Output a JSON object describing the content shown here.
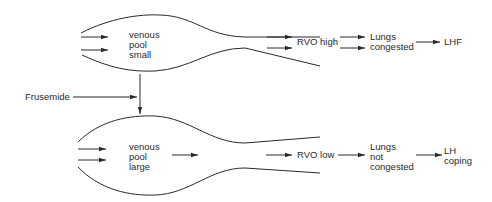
{
  "top_pathway": {
    "venous_pool": [
      "venous",
      "pool",
      "small"
    ],
    "rvo": "RVO high",
    "lungs": [
      "Lungs",
      "congested"
    ],
    "outcome": "LHF"
  },
  "drug": {
    "label": "Frusemide"
  },
  "bottom_pathway": {
    "venous_pool": [
      "venous",
      "pool",
      "large"
    ],
    "rvo": "RVO low",
    "lungs": [
      "Lungs",
      "not",
      "congested"
    ],
    "outcome": [
      "LH",
      "coping"
    ]
  },
  "colors": {
    "line": "#2a2a2a",
    "background": "#ffffff"
  }
}
